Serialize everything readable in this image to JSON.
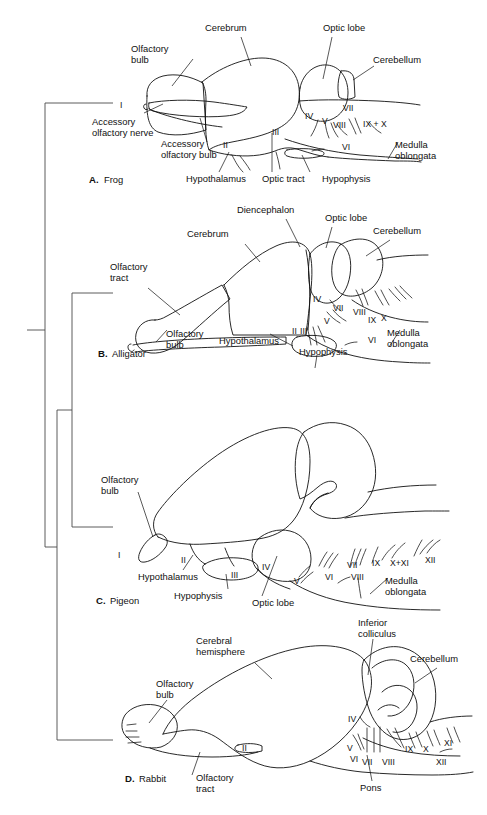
{
  "figure": {
    "background": "#ffffff",
    "colors": {
      "cerebrum": "#a9bfc4",
      "cerebellum": "#d9d69b",
      "unshaded": "#ffffff",
      "outline": "#111111",
      "tree": "#4a4a4a"
    }
  },
  "panels": [
    {
      "id": "frog",
      "letter": "A.",
      "species": "Frog",
      "labels": [
        "Cerebrum",
        "Optic lobe",
        "Cerebellum",
        "Olfactory bulb",
        "Accessory olfactory nerve",
        "Accessory olfactory bulb",
        "Hypothalamus",
        "Optic tract",
        "Hypophysis",
        "Medulla oblongata"
      ],
      "cranial_nerves": [
        "I",
        "II",
        "III",
        "IV",
        "V",
        "VI",
        "VII",
        "VIII",
        "IX + X"
      ]
    },
    {
      "id": "alligator",
      "letter": "B.",
      "species": "Alligator",
      "labels": [
        "Diencephalon",
        "Cerebrum",
        "Optic lobe",
        "Cerebellum",
        "Olfactory tract",
        "Olfactory bulb",
        "Hypothalamus",
        "Hypophysis",
        "Medulla oblongata"
      ],
      "cranial_nerves": [
        "II",
        "III",
        "IV",
        "V",
        "VI",
        "VII",
        "VIII",
        "IX",
        "X"
      ]
    },
    {
      "id": "pigeon",
      "letter": "C.",
      "species": "Pigeon",
      "labels": [
        "Olfactory bulb",
        "Hypothalamus",
        "Hypophysis",
        "Optic lobe",
        "Medulla oblongata"
      ],
      "cranial_nerves": [
        "I",
        "II",
        "III",
        "IV",
        "V",
        "VI",
        "VII",
        "VIII",
        "IX",
        "X+XI",
        "XII"
      ]
    },
    {
      "id": "rabbit",
      "letter": "D.",
      "species": "Rabbit",
      "labels": [
        "Inferior colliculus",
        "Cerebral hemisphere",
        "Cerebellum",
        "Olfactory bulb",
        "Olfactory tract",
        "Pons"
      ],
      "cranial_nerves": [
        "II",
        "IV",
        "V",
        "VI",
        "VII",
        "VIII",
        "IX",
        "X",
        "XI",
        "XII"
      ]
    }
  ],
  "labels_flat": {
    "cerebrum": "Cerebrum",
    "optic_lobe": "Optic lobe",
    "cerebellum": "Cerebellum",
    "olfactory_bulb_1": "Olfactory",
    "olfactory_bulb_2": "bulb",
    "accessory_olf_nerve_1": "Accessory",
    "accessory_olf_nerve_2": "olfactory nerve",
    "accessory_olf_bulb_1": "Accessory",
    "accessory_olf_bulb_2": "olfactory bulb",
    "hypothalamus": "Hypothalamus",
    "optic_tract": "Optic tract",
    "hypophysis": "Hypophysis",
    "medulla_1": "Medulla",
    "medulla_2": "oblongata",
    "diencephalon": "Diencephalon",
    "olfactory_tract_1": "Olfactory",
    "olfactory_tract_2": "tract",
    "cerebral_hemisphere_1": "Cerebral",
    "cerebral_hemisphere_2": "hemisphere",
    "inferior_colliculus_1": "Inferior",
    "inferior_colliculus_2": "colliculus",
    "pons": "Pons"
  },
  "roman": {
    "I": "I",
    "II": "II",
    "III": "III",
    "IV": "IV",
    "V": "V",
    "VI": "VI",
    "VII": "VII",
    "VIII": "VIII",
    "IX": "IX",
    "X": "X",
    "XI": "XI",
    "XII": "XII",
    "IXX": "IX + X",
    "XXI": "X+XI"
  },
  "panel_letters": {
    "a": "A.",
    "b": "B.",
    "c": "C.",
    "d": "D."
  },
  "panel_species": {
    "frog": "Frog",
    "alligator": "Alligator",
    "pigeon": "Pigeon",
    "rabbit": "Rabbit"
  },
  "cladogram": {
    "description": "Phylogenetic bracket linking the four taxa",
    "tips": [
      "Frog",
      "Alligator",
      "Pigeon",
      "Rabbit"
    ]
  }
}
